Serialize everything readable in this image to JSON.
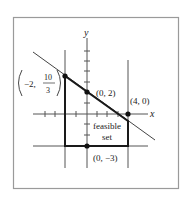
{
  "figure": {
    "axis_labels": {
      "x": "x",
      "y": "y"
    },
    "points": [
      {
        "id": "p1",
        "coords": [
          -2,
          3.333
        ],
        "label_prefix": "−2,",
        "label_num": "10",
        "label_den": "3"
      },
      {
        "id": "p2",
        "coords": [
          0,
          2
        ],
        "label": "(0, 2)"
      },
      {
        "id": "p3",
        "coords": [
          4,
          0
        ],
        "label": "(4, 0)"
      },
      {
        "id": "p4",
        "coords": [
          0,
          -3
        ],
        "label": "(0, −3)"
      }
    ],
    "region_label": {
      "line1": "feasible",
      "line2": "set"
    },
    "boundaries": [
      {
        "type": "line",
        "equation": "x + 1.5y = 3 (approx)",
        "through": [
          [
            -2,
            3.333
          ],
          [
            0,
            2
          ]
        ]
      },
      {
        "type": "vertical",
        "x": -2
      },
      {
        "type": "vertical",
        "x": 4
      },
      {
        "type": "horizontal",
        "y": -3
      }
    ],
    "colors": {
      "line": "#222222",
      "axis": "#555555",
      "frame": "#999999",
      "background": "#ffffff"
    }
  }
}
